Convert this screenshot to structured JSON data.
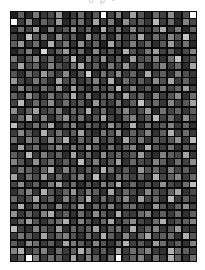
{
  "figure": {
    "title": "",
    "clipped_caption": "o  p                    -",
    "background_color": "#ffffff",
    "grid_gap_color": "#0a0a0a",
    "plot_left": 10,
    "plot_top": 11,
    "plot_width": 187,
    "plot_height": 251
  },
  "chart_data": {
    "type": "heatmap",
    "title": "",
    "subtitle": "",
    "xlabel": "",
    "ylabel": "",
    "xticklabels": [],
    "yticklabels": [],
    "legend": [],
    "colormap": "gray",
    "vmin": 0,
    "vmax": 255,
    "grid": true,
    "rows": 34,
    "cols": 25,
    "cell_gap_px": 1,
    "note": "Grayscale matrix; bright/white cells align along diagonal bands running from upper-right toward lower-left.",
    "values": [
      [
        30,
        95,
        40,
        120,
        55,
        75,
        150,
        35,
        60,
        110,
        45,
        90,
        250,
        70,
        130,
        50,
        160,
        85,
        40,
        105,
        65,
        140,
        45,
        75,
        255
      ],
      [
        255,
        60,
        135,
        45,
        100,
        70,
        155,
        40,
        90,
        115,
        50,
        165,
        60,
        125,
        35,
        145,
        75,
        95,
        55,
        185,
        60,
        110,
        40,
        130,
        70
      ],
      [
        45,
        110,
        70,
        160,
        35,
        125,
        55,
        90,
        145,
        60,
        100,
        40,
        175,
        65,
        115,
        50,
        135,
        80,
        60,
        95,
        170,
        55,
        120,
        40,
        100
      ],
      [
        70,
        40,
        190,
        85,
        115,
        50,
        140,
        65,
        95,
        35,
        155,
        75,
        105,
        45,
        125,
        60,
        90,
        170,
        50,
        110,
        65,
        135,
        85,
        195,
        55
      ],
      [
        95,
        150,
        55,
        110,
        40,
        175,
        70,
        120,
        50,
        145,
        60,
        100,
        35,
        165,
        80,
        55,
        125,
        65,
        105,
        45,
        90,
        155,
        60,
        115,
        40
      ],
      [
        35,
        75,
        125,
        45,
        215,
        60,
        100,
        155,
        70,
        110,
        40,
        135,
        65,
        90,
        50,
        175,
        85,
        55,
        120,
        160,
        65,
        100,
        45,
        75,
        130
      ],
      [
        120,
        55,
        90,
        140,
        65,
        105,
        45,
        80,
        185,
        50,
        120,
        70,
        145,
        55,
        100,
        40,
        160,
        75,
        90,
        130,
        50,
        110,
        195,
        60,
        85
      ],
      [
        60,
        165,
        75,
        100,
        50,
        130,
        85,
        55,
        110,
        175,
        65,
        95,
        45,
        120,
        70,
        150,
        55,
        100,
        40,
        85,
        130,
        60,
        105,
        45,
        165
      ],
      [
        85,
        45,
        110,
        70,
        155,
        95,
        60,
        135,
        45,
        90,
        205,
        50,
        115,
        75,
        140,
        60,
        100,
        45,
        170,
        65,
        95,
        50,
        125,
        80,
        55
      ],
      [
        150,
        70,
        55,
        120,
        90,
        45,
        165,
        75,
        105,
        55,
        85,
        130,
        60,
        175,
        45,
        110,
        70,
        95,
        55,
        140,
        80,
        165,
        60,
        100,
        45
      ],
      [
        50,
        130,
        95,
        60,
        110,
        70,
        145,
        50,
        160,
        85,
        55,
        105,
        75,
        95,
        185,
        65,
        130,
        55,
        90,
        45,
        120,
        70,
        100,
        155,
        65
      ],
      [
        100,
        60,
        145,
        85,
        50,
        120,
        65,
        95,
        175,
        60,
        130,
        45,
        90,
        110,
        55,
        165,
        75,
        105,
        45,
        130,
        60,
        85,
        140,
        50,
        110
      ],
      [
        65,
        185,
        50,
        105,
        75,
        140,
        55,
        110,
        65,
        95,
        45,
        150,
        85,
        60,
        125,
        50,
        95,
        195,
        70,
        105,
        55,
        135,
        65,
        90,
        160
      ],
      [
        140,
        55,
        95,
        160,
        65,
        85,
        125,
        45,
        105,
        70,
        175,
        60,
        110,
        50,
        90,
        135,
        60,
        80,
        150,
        45,
        115,
        70,
        100,
        55,
        95
      ],
      [
        55,
        105,
        170,
        60,
        130,
        50,
        95,
        145,
        75,
        115,
        55,
        90,
        165,
        70,
        45,
        105,
        130,
        60,
        95,
        185,
        65,
        110,
        50,
        140,
        70
      ],
      [
        190,
        70,
        60,
        115,
        85,
        165,
        45,
        90,
        130,
        50,
        105,
        75,
        55,
        145,
        95,
        60,
        175,
        50,
        110,
        65,
        90,
        130,
        60,
        100,
        45
      ],
      [
        60,
        135,
        90,
        50,
        175,
        70,
        115,
        60,
        95,
        160,
        65,
        45,
        120,
        85,
        150,
        55,
        100,
        70,
        130,
        50,
        95,
        175,
        65,
        110,
        55
      ],
      [
        110,
        50,
        125,
        95,
        60,
        140,
        85,
        175,
        50,
        105,
        70,
        130,
        60,
        95,
        45,
        165,
        80,
        120,
        55,
        100,
        70,
        90,
        145,
        60,
        185
      ],
      [
        45,
        160,
        70,
        110,
        50,
        95,
        135,
        60,
        120,
        75,
        155,
        90,
        50,
        110,
        65,
        95,
        130,
        45,
        170,
        85,
        60,
        115,
        50,
        95,
        70
      ],
      [
        95,
        60,
        185,
        55,
        125,
        70,
        100,
        45,
        165,
        60,
        110,
        50,
        140,
        75,
        105,
        60,
        90,
        155,
        65,
        45,
        130,
        95,
        75,
        165,
        55
      ],
      [
        130,
        85,
        50,
        145,
        70,
        110,
        55,
        95,
        60,
        185,
        70,
        125,
        55,
        90,
        160,
        50,
        105,
        75,
        60,
        130,
        95,
        50,
        110,
        65,
        140
      ],
      [
        55,
        115,
        95,
        60,
        100,
        175,
        50,
        130,
        85,
        55,
        95,
        65,
        175,
        110,
        60,
        90,
        45,
        150,
        85,
        105,
        55,
        125,
        70,
        95,
        50
      ],
      [
        165,
        50,
        110,
        75,
        155,
        60,
        105,
        50,
        95,
        130,
        60,
        185,
        70,
        50,
        115,
        95,
        65,
        100,
        55,
        175,
        70,
        95,
        135,
        60,
        105
      ],
      [
        70,
        140,
        60,
        95,
        50,
        120,
        165,
        70,
        110,
        45,
        90,
        55,
        130,
        95,
        175,
        60,
        105,
        50,
        85,
        60,
        145,
        75,
        55,
        110,
        190
      ],
      [
        50,
        95,
        130,
        55,
        175,
        85,
        60,
        100,
        150,
        65,
        120,
        95,
        50,
        165,
        60,
        105,
        75,
        55,
        135,
        90,
        60,
        100,
        165,
        50,
        75
      ],
      [
        105,
        60,
        85,
        165,
        65,
        100,
        45,
        130,
        70,
        95,
        175,
        55,
        110,
        60,
        90,
        135,
        50,
        160,
        70,
        105,
        50,
        185,
        60,
        95,
        55
      ],
      [
        60,
        175,
        50,
        110,
        95,
        55,
        135,
        60,
        90,
        160,
        50,
        105,
        75,
        130,
        55,
        95,
        110,
        60,
        45,
        150,
        85,
        55,
        100,
        140,
        65
      ],
      [
        145,
        55,
        105,
        60,
        130,
        170,
        65,
        95,
        50,
        110,
        60,
        140,
        95,
        50,
        175,
        70,
        60,
        105,
        130,
        55,
        95,
        60,
        110,
        50,
        95
      ],
      [
        55,
        100,
        160,
        85,
        50,
        95,
        110,
        175,
        60,
        130,
        85,
        50,
        105,
        165,
        60,
        95,
        140,
        70,
        50,
        110,
        175,
        60,
        85,
        95,
        130
      ],
      [
        185,
        65,
        50,
        130,
        95,
        60,
        155,
        50,
        105,
        70,
        95,
        160,
        55,
        90,
        110,
        50,
        175,
        60,
        100,
        130,
        55,
        85,
        155,
        60,
        50
      ],
      [
        60,
        120,
        95,
        55,
        165,
        70,
        100,
        130,
        85,
        50,
        110,
        60,
        175,
        95,
        50,
        135,
        60,
        105,
        165,
        70,
        95,
        110,
        50,
        175,
        85
      ],
      [
        95,
        50,
        140,
        110,
        60,
        95,
        50,
        165,
        120,
        95,
        60,
        130,
        85,
        50,
        105,
        175,
        65,
        90,
        50,
        155,
        110,
        60,
        95,
        50,
        130
      ],
      [
        130,
        175,
        60,
        95,
        130,
        50,
        110,
        60,
        95,
        175,
        130,
        60,
        95,
        50,
        165,
        60,
        110,
        95,
        130,
        60,
        50,
        175,
        110,
        95,
        60
      ],
      [
        50,
        95,
        255,
        130,
        60,
        110,
        95,
        50,
        165,
        60,
        130,
        95,
        50,
        110,
        255,
        60,
        95,
        130,
        50,
        110,
        60,
        175,
        95,
        50,
        110
      ]
    ]
  }
}
